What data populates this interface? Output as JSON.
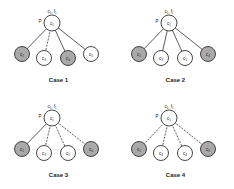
{
  "colors": {
    "filled": "#a9a9a9",
    "empty": "#ffffff",
    "stroke": "#333333",
    "text": "#222222"
  },
  "cases": [
    {
      "label": "Case 1",
      "root": {
        "label": "c₁",
        "top_label": "c₁, f₁",
        "side_label": "P"
      },
      "children": [
        {
          "label": "c₂",
          "filled": true,
          "edge": "solid"
        },
        {
          "label": "c₃",
          "filled": false,
          "edge": "dashed"
        },
        {
          "label": "c₄",
          "filled": true,
          "edge": "solid"
        },
        {
          "label": "c₅",
          "filled": false,
          "edge": "solid"
        }
      ]
    },
    {
      "label": "Case 2",
      "root": {
        "label": "c₁",
        "top_label": "c₁, f₁",
        "side_label": "P"
      },
      "children": [
        {
          "label": "c₂",
          "filled": true,
          "edge": "solid"
        },
        {
          "label": "c₃",
          "filled": false,
          "edge": "solid"
        },
        {
          "label": "c₅",
          "filled": false,
          "edge": "solid"
        },
        {
          "label": "c₄",
          "filled": true,
          "edge": "solid"
        }
      ]
    },
    {
      "label": "Case 3",
      "root": {
        "label": "c₁",
        "top_label": "c₁, f₁",
        "side_label": "P"
      },
      "children": [
        {
          "label": "c₂",
          "filled": true,
          "edge": "solid"
        },
        {
          "label": "c₃",
          "filled": false,
          "edge": "dashed"
        },
        {
          "label": "c₅",
          "filled": false,
          "edge": "dashed"
        },
        {
          "label": "c₄",
          "filled": true,
          "edge": "dashed"
        }
      ]
    },
    {
      "label": "Case 4",
      "root": {
        "label": "c₁",
        "top_label": "c₁, f₁",
        "side_label": "P"
      },
      "children": [
        {
          "label": "c₂",
          "filled": true,
          "edge": "dashed"
        },
        {
          "label": "c₃",
          "filled": false,
          "edge": "dashed"
        },
        {
          "label": "c₄",
          "filled": false,
          "edge": "dashed"
        },
        {
          "label": "c₅",
          "filled": true,
          "edge": "dashed"
        }
      ]
    }
  ]
}
